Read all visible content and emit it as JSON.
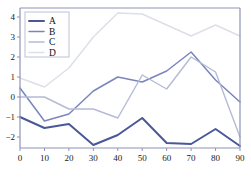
{
  "chart_data": {
    "type": "line",
    "title": "",
    "xlabel": "",
    "ylabel": "",
    "x": [
      0,
      10,
      20,
      30,
      40,
      50,
      60,
      70,
      80,
      90
    ],
    "xlim": [
      0,
      90
    ],
    "ylim": [
      -2.55,
      4.45
    ],
    "xticks": [
      "0",
      "10",
      "20",
      "30",
      "40",
      "50",
      "60",
      "70",
      "80",
      "90"
    ],
    "yticks": [
      "4",
      "3",
      "2",
      "1",
      "0",
      "-1",
      "-2"
    ],
    "ytick_values": [
      4,
      3,
      2,
      1,
      0,
      -1,
      -2
    ],
    "grid": false,
    "legend_position": "upper-left",
    "series": [
      {
        "name": "A",
        "color": "#4a5899",
        "width": 2.0,
        "values": [
          -1.0,
          -1.55,
          -1.35,
          -2.4,
          -1.9,
          -1.05,
          -2.3,
          -2.35,
          -1.6,
          -2.45
        ]
      },
      {
        "name": "B",
        "color": "#7a85bd",
        "width": 1.5,
        "values": [
          0.45,
          -1.2,
          -0.85,
          0.3,
          1.0,
          0.75,
          1.3,
          2.25,
          0.85,
          -0.25
        ]
      },
      {
        "name": "C",
        "color": "#b5bad6",
        "width": 1.4,
        "values": [
          0.0,
          0.0,
          -0.6,
          -0.6,
          -1.05,
          1.1,
          0.4,
          2.0,
          1.25,
          -2.0
        ]
      },
      {
        "name": "D",
        "color": "#dcdfe9",
        "width": 1.4,
        "values": [
          0.95,
          0.5,
          1.45,
          3.0,
          4.2,
          4.15,
          3.6,
          3.05,
          3.6,
          3.05
        ]
      }
    ]
  },
  "axes": {
    "spine_color": "#8d93b8",
    "tick_color": "#8d93b8"
  },
  "legend": {
    "entries": [
      "A",
      "B",
      "C",
      "D"
    ],
    "border_color": "#bcc0d4",
    "background": "#ffffff"
  },
  "caption": {
    "text": "",
    "color": "#9aa0bb"
  }
}
